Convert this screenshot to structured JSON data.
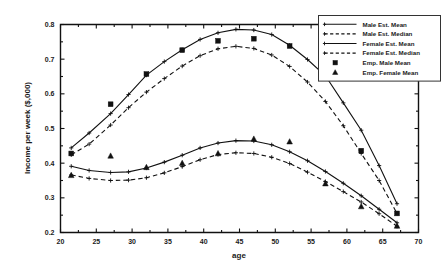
{
  "chart_data": {
    "type": "line",
    "title": "",
    "xlabel": "age",
    "ylabel": "Income per week ($,000)",
    "xlim": [
      20,
      70
    ],
    "ylim": [
      0.2,
      0.8
    ],
    "xticks": [
      20,
      25,
      30,
      35,
      40,
      45,
      50,
      55,
      60,
      65,
      70
    ],
    "yticks": [
      0.2,
      0.3,
      0.4,
      0.5,
      0.6,
      0.7,
      0.8
    ],
    "xtick_labels": [
      "20",
      "25",
      "30",
      "35",
      "40",
      "45",
      "50",
      "55",
      "60",
      "65",
      "70"
    ],
    "ytick_labels": [
      "0.2",
      "0.3",
      "0.4",
      "0.5",
      "0.6",
      "0.7",
      "0.8"
    ],
    "grid": false,
    "legend_position": "top-right",
    "series": [
      {
        "name": "Male Est. Mean",
        "style": "solid",
        "marker": "plus",
        "x": [
          21.5,
          24.0,
          27.0,
          29.5,
          32.0,
          34.5,
          37.0,
          39.5,
          42.0,
          44.5,
          47.0,
          49.5,
          52.0,
          54.5,
          57.0,
          59.5,
          62.0,
          64.5,
          67.0
        ],
        "y": [
          0.444,
          0.487,
          0.543,
          0.598,
          0.654,
          0.693,
          0.727,
          0.757,
          0.776,
          0.786,
          0.784,
          0.771,
          0.74,
          0.699,
          0.652,
          0.574,
          0.495,
          0.393,
          0.283
        ]
      },
      {
        "name": "Male Est. Median",
        "style": "dashed",
        "marker": "plus",
        "x": [
          21.5,
          24.0,
          27.0,
          29.5,
          32.0,
          34.5,
          37.0,
          39.5,
          42.0,
          44.5,
          47.0,
          49.5,
          52.0,
          54.5,
          57.0,
          59.5,
          62.0,
          64.5,
          67.0
        ],
        "y": [
          0.424,
          0.455,
          0.51,
          0.56,
          0.605,
          0.644,
          0.68,
          0.71,
          0.73,
          0.737,
          0.731,
          0.712,
          0.679,
          0.634,
          0.578,
          0.508,
          0.428,
          0.35,
          0.255
        ]
      },
      {
        "name": "Female Est. Mean",
        "style": "solid",
        "marker": "plus",
        "x": [
          21.5,
          24.0,
          27.0,
          29.5,
          32.0,
          34.5,
          37.0,
          39.5,
          42.0,
          44.5,
          47.0,
          49.5,
          52.0,
          54.5,
          57.0,
          59.5,
          62.0,
          64.5,
          67.0
        ],
        "y": [
          0.391,
          0.379,
          0.373,
          0.375,
          0.386,
          0.403,
          0.423,
          0.444,
          0.458,
          0.465,
          0.464,
          0.453,
          0.433,
          0.407,
          0.376,
          0.342,
          0.306,
          0.267,
          0.228
        ]
      },
      {
        "name": "Female Est. Median",
        "style": "dashed",
        "marker": "plus",
        "x": [
          21.5,
          24.0,
          27.0,
          29.5,
          32.0,
          34.5,
          37.0,
          39.5,
          42.0,
          44.5,
          47.0,
          49.5,
          52.0,
          54.5,
          57.0,
          59.5,
          62.0,
          64.5,
          67.0
        ],
        "y": [
          0.366,
          0.356,
          0.35,
          0.351,
          0.358,
          0.372,
          0.39,
          0.41,
          0.425,
          0.43,
          0.428,
          0.417,
          0.399,
          0.374,
          0.347,
          0.318,
          0.288,
          0.254,
          0.218
        ]
      },
      {
        "name": "Emp. Male Mean",
        "style": "none",
        "marker": "square",
        "x": [
          21.5,
          27.0,
          32.0,
          37.0,
          42.0,
          47.0,
          52.0,
          57.0,
          62.0,
          67.0
        ],
        "y": [
          0.428,
          0.57,
          0.657,
          0.726,
          0.753,
          0.759,
          0.738,
          0.652,
          0.436,
          0.255
        ]
      },
      {
        "name": "Emp. Female Mean",
        "style": "none",
        "marker": "triangle",
        "x": [
          21.5,
          27.0,
          32.0,
          37.0,
          42.0,
          47.0,
          52.0,
          57.0,
          62.0,
          67.0
        ],
        "y": [
          0.365,
          0.421,
          0.388,
          0.4,
          0.428,
          0.47,
          0.462,
          0.341,
          0.275,
          0.219
        ]
      }
    ]
  },
  "legend": {
    "entries": [
      {
        "label": "Male Est. Mean",
        "kind": "line-solid-plus"
      },
      {
        "label": "Male Est. Median",
        "kind": "line-dashed-plus"
      },
      {
        "label": "Female Est. Mean",
        "kind": "line-solid-plus"
      },
      {
        "label": "Female Est. Median",
        "kind": "line-dashed-plus"
      },
      {
        "label": "Emp. Male Mean",
        "kind": "marker-square"
      },
      {
        "label": "Emp. Female Mean",
        "kind": "marker-triangle"
      }
    ]
  },
  "axes": {
    "x_title": "age",
    "y_title": "Income per week ($,000)"
  },
  "colors": {
    "ink": "#111111",
    "background": "#ffffff",
    "legend_border": "#333333"
  }
}
